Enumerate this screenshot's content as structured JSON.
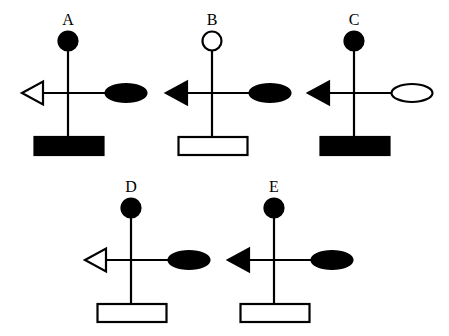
{
  "figure": {
    "type": "symbol-option-diagram",
    "colors": {
      "ink": "#000000",
      "background": "#ffffff"
    },
    "options": [
      {
        "label": "A",
        "center": [
          68,
          93
        ],
        "top_circle": "filled",
        "left_triangle": "open",
        "right_ellipse": "filled",
        "bottom_rect": "filled"
      },
      {
        "label": "B",
        "center": [
          212,
          93
        ],
        "top_circle": "open",
        "left_triangle": "filled",
        "right_ellipse": "filled",
        "bottom_rect": "open"
      },
      {
        "label": "C",
        "center": [
          354,
          93
        ],
        "top_circle": "filled",
        "left_triangle": "filled",
        "right_ellipse": "open",
        "bottom_rect": "filled"
      },
      {
        "label": "D",
        "center": [
          131,
          260
        ],
        "top_circle": "filled",
        "left_triangle": "open",
        "right_ellipse": "filled",
        "bottom_rect": "open"
      },
      {
        "label": "E",
        "center": [
          274,
          260
        ],
        "top_circle": "filled",
        "left_triangle": "filled",
        "right_ellipse": "filled",
        "bottom_rect": "open"
      }
    ]
  }
}
